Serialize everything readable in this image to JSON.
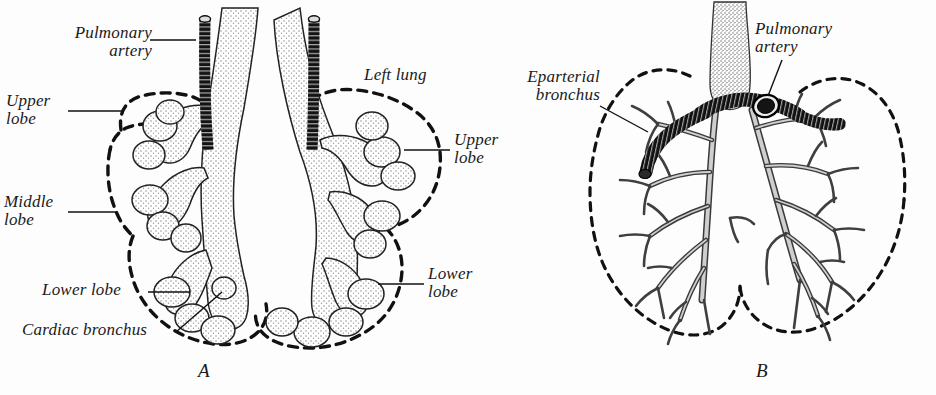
{
  "figure": {
    "background_color": "#fdfdfd",
    "ink_color": "#1a1a1a",
    "stipple_color": "#8c8c8c",
    "artery_color": "#111111"
  },
  "panels": [
    {
      "id": "A",
      "letter": "A",
      "labels": [
        {
          "key": "pulmonary_artery",
          "text": "Pulmonary\nartery"
        },
        {
          "key": "upper_lobe_left",
          "text": "Upper\nlobe"
        },
        {
          "key": "middle_lobe",
          "text": "Middle\nlobe"
        },
        {
          "key": "lower_lobe_left",
          "text": "Lower lobe"
        },
        {
          "key": "cardiac_bronchus",
          "text": "Cardiac bronchus"
        },
        {
          "key": "left_lung",
          "text": "Left lung"
        },
        {
          "key": "upper_lobe_right",
          "text": "Upper\nlobe"
        },
        {
          "key": "lower_lobe_right",
          "text": "Lower\nlobe"
        }
      ]
    },
    {
      "id": "B",
      "letter": "B",
      "labels": [
        {
          "key": "eparterial_bronchus",
          "text": "Eparterial\nbronchus"
        },
        {
          "key": "pulmonary_artery",
          "text": "Pulmonary\nartery"
        }
      ]
    }
  ],
  "labels_flat": {
    "a_pulmonary_artery": "Pulmonary\nartery",
    "a_upper_lobe_left": "Upper\nlobe",
    "a_middle_lobe": "Middle\nlobe",
    "a_lower_lobe_left": "Lower lobe",
    "a_cardiac_bronchus": "Cardiac bronchus",
    "a_left_lung": "Left lung",
    "a_upper_lobe_right": "Upper\nlobe",
    "a_lower_lobe_right": "Lower\nlobe",
    "a_letter": "A",
    "b_eparterial_bronchus": "Eparterial\nbronchus",
    "b_pulmonary_artery": "Pulmonary\nartery",
    "b_letter": "B"
  }
}
